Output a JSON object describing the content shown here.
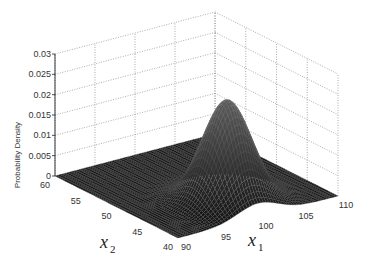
{
  "chart_data": {
    "type": "surface3d",
    "title": "",
    "xlabel": "x1",
    "ylabel": "x2",
    "zlabel": "Probability Density",
    "x_ticks": [
      90,
      95,
      100,
      105,
      110
    ],
    "y_ticks": [
      40,
      45,
      50,
      55,
      60
    ],
    "z_ticks": [
      "0",
      "0.005",
      "0.01",
      "0.015",
      "0.02",
      "0.025",
      "0.03"
    ],
    "xlim": [
      90,
      110
    ],
    "ylim": [
      40,
      60
    ],
    "zlim": [
      0,
      0.03
    ],
    "grid": true,
    "distribution": {
      "mean": [
        100,
        45
      ],
      "std": [
        2.5,
        2.5
      ],
      "peak_density": 0.025
    },
    "colormap": "gray-mesh"
  },
  "labels": {
    "x_main": "x",
    "x_sub": "1",
    "y_main": "x",
    "y_sub": "2",
    "z": "Probability Density"
  }
}
